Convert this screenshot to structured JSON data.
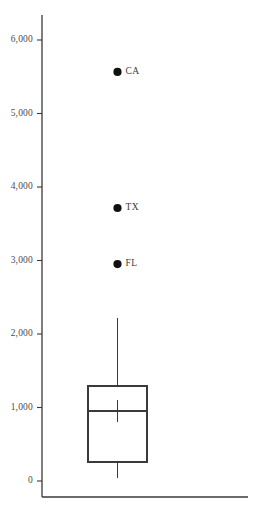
{
  "chart_data": {
    "type": "box",
    "title": "",
    "xlabel": "",
    "ylabel": "",
    "ylim": [
      0,
      6300
    ],
    "grid": false,
    "legend": false,
    "axis_color": "#3a3a3a",
    "box_color": "#3a3a3a",
    "point_color": "#111111",
    "tick_labels": [
      {
        "value": 6000,
        "text": "6,000"
      },
      {
        "value": 5000,
        "text": "5,000"
      },
      {
        "value": 4000,
        "text": "4,000"
      },
      {
        "value": 3000,
        "text": "3,000"
      },
      {
        "value": 2000,
        "text": "2,000"
      },
      {
        "value": 1000,
        "text": "1,000"
      },
      {
        "value": 0,
        "text": "0"
      }
    ],
    "box": {
      "whisker_high": 2218,
      "q3": 1292,
      "median": 952,
      "mean": 952,
      "q1": 258,
      "whisker_low": 41
    },
    "outliers": [
      {
        "label": "CA",
        "value": 5565
      },
      {
        "label": "TX",
        "value": 3714
      },
      {
        "label": "FL",
        "value": 2952
      }
    ]
  }
}
